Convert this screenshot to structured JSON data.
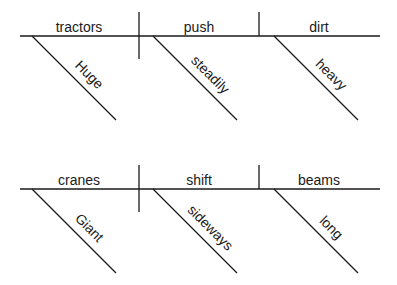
{
  "diagram": {
    "type": "sentence-diagram",
    "sentences": [
      {
        "subject": "tractors",
        "verb": "push",
        "object": "dirt",
        "subject_modifier": "Huge",
        "verb_modifier": "steadily",
        "object_modifier": "heavy"
      },
      {
        "subject": "cranes",
        "verb": "shift",
        "object": "beams",
        "subject_modifier": "Giant",
        "verb_modifier": "sideways",
        "object_modifier": "long"
      }
    ]
  }
}
